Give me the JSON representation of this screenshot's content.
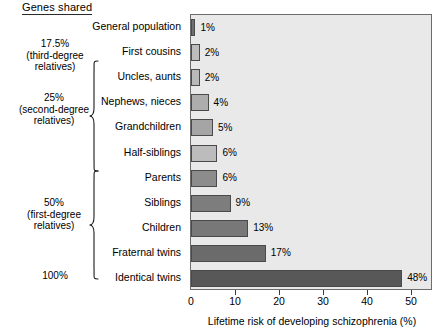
{
  "header": {
    "genes_shared_label": "Genes shared"
  },
  "groups": [
    {
      "name": "third-degree",
      "percent": "17.5%",
      "line2": "(third-degree",
      "line3": "relatives)",
      "has_brace": false
    },
    {
      "name": "second-degree",
      "percent": "25%",
      "line2": "(second-degree",
      "line3": "relatives)",
      "has_brace": true
    },
    {
      "name": "first-degree",
      "percent": "50%",
      "line2": "(first-degree",
      "line3": "relatives)",
      "has_brace": true
    },
    {
      "name": "identical",
      "percent": "100%",
      "line2": "",
      "line3": "",
      "has_brace": false
    }
  ],
  "chart_data": {
    "type": "bar",
    "orientation": "horizontal",
    "title": "",
    "xlabel": "Lifetime risk of developing schizophrenia (%)",
    "ylabel": "",
    "xlim": [
      0,
      55
    ],
    "xticks": [
      0,
      10,
      20,
      30,
      40,
      50
    ],
    "xtick_labels": [
      "0",
      "10",
      "20",
      "30",
      "40",
      "50"
    ],
    "grid": false,
    "legend": "none",
    "categories": [
      "General population",
      "First cousins",
      "Uncles, aunts",
      "Nephews, nieces",
      "Grandchildren",
      "Half-siblings",
      "Parents",
      "Siblings",
      "Children",
      "Fraternal twins",
      "Identical twins"
    ],
    "values": [
      1,
      2,
      2,
      4,
      5,
      6,
      6,
      9,
      13,
      17,
      48
    ],
    "value_labels": [
      "1%",
      "2%",
      "2%",
      "4%",
      "5%",
      "6%",
      "6%",
      "9%",
      "13%",
      "17%",
      "48%"
    ],
    "bar_colors": [
      "#6f6f6f",
      "#bdbdbd",
      "#b9b9b9",
      "#adadad",
      "#a5a5a5",
      "#bcbcbc",
      "#8c8c8c",
      "#7d7d7d",
      "#787878",
      "#6b6b6b",
      "#585858"
    ],
    "plot_background": "#e9e9e9",
    "bar_edge_color": "#4a4a4a",
    "axis_color": "#3a3a3a"
  }
}
